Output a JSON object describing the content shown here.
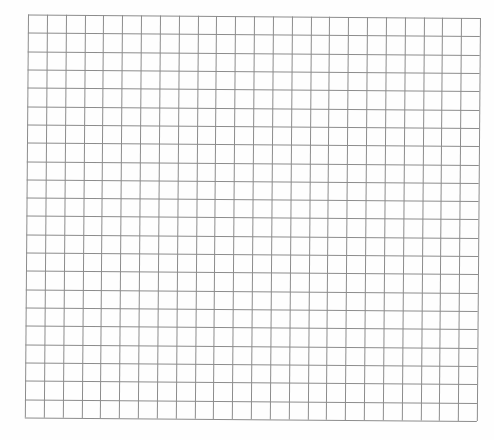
{
  "page": {
    "background_color": "#fefefe"
  },
  "grid": {
    "columns": 24,
    "rows": 22,
    "line_color": "#8c8c8c",
    "line_width": 1,
    "origin": {
      "x": 28,
      "y": 14
    },
    "width": 452,
    "height": 403,
    "rotation_deg": 0.45
  }
}
